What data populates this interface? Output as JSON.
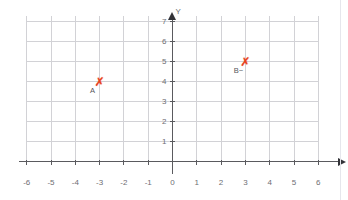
{
  "chart_data": {
    "type": "scatter",
    "title": "",
    "xlabel": "X",
    "ylabel": "Y",
    "xlim": [
      -6,
      6
    ],
    "ylim": [
      0,
      7
    ],
    "grid": true,
    "legend": "none",
    "x_ticks": [
      "-6",
      "-5",
      "-4",
      "-3",
      "-2",
      "-1",
      "0",
      "1",
      "2",
      "3",
      "4",
      "5",
      "6"
    ],
    "x_tick_values": [
      -6,
      -5,
      -4,
      -3,
      -2,
      -1,
      0,
      1,
      2,
      3,
      4,
      5,
      6
    ],
    "y_ticks": [
      "1",
      "2",
      "3",
      "4",
      "5",
      "6",
      "7"
    ],
    "y_tick_values": [
      1,
      2,
      3,
      4,
      5,
      6,
      7
    ],
    "points": [
      {
        "label": "A",
        "x": -3,
        "y": 4,
        "marker": "✗",
        "color": "#e8401c"
      },
      {
        "label": "B~",
        "x": 3,
        "y": 5,
        "marker": "✗",
        "color": "#e8401c"
      }
    ]
  },
  "colors": {
    "grid": "#d2d2d6",
    "axis": "#5a5a5e",
    "marker": "#e8401c",
    "tick_label": "#6e6e73",
    "background": "#ffffff"
  },
  "axes": {
    "x_axis_name": "X",
    "y_axis_name": "Y"
  }
}
